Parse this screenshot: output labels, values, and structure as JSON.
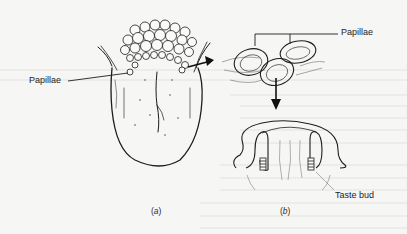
{
  "figure": {
    "panels": [
      {
        "id": "a",
        "caption": "a",
        "description": "tongue with papillae cluster at back"
      },
      {
        "id": "b",
        "caption": "b",
        "description": "enlarged papillae and cross-section showing taste buds"
      }
    ],
    "labels": {
      "papillae_left": "Papillae",
      "papillae_right": "Papillae",
      "taste_bud": "Taste bud"
    },
    "colors": {
      "background": "#f6f6f4",
      "ink": "#1d1d1d",
      "bleed_text": "#dcdcdc"
    }
  }
}
